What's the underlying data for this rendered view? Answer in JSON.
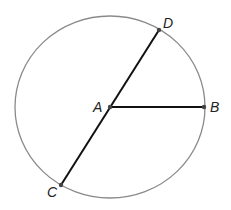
{
  "diagram": {
    "type": "circle-geometry",
    "circle": {
      "cx": 110,
      "cy": 107,
      "rx": 95,
      "ry": 91,
      "stroke": "#8a8a8a"
    },
    "points": {
      "A": {
        "label": "A",
        "x": 110,
        "y": 107,
        "label_x": 93,
        "label_y": 112
      },
      "B": {
        "label": "B",
        "x": 204,
        "y": 107,
        "label_x": 210,
        "label_y": 112
      },
      "C": {
        "label": "C",
        "x": 61,
        "y": 185,
        "label_x": 47,
        "label_y": 197
      },
      "D": {
        "label": "D",
        "x": 159,
        "y": 30,
        "label_x": 163,
        "label_y": 28
      }
    },
    "segments": [
      {
        "name": "diameter-CD",
        "from": "C",
        "to": "D"
      },
      {
        "name": "radius-AB",
        "from": "A",
        "to": "B"
      }
    ],
    "segment_color": "#111111",
    "point_color": "#444444"
  }
}
